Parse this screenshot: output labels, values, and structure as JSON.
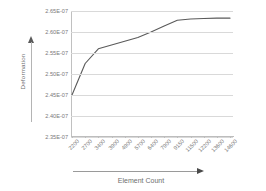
{
  "chart_data": {
    "type": "line",
    "title": "",
    "xlabel": "Element Count",
    "ylabel": "Deformation",
    "categories": [
      "2200",
      "2700",
      "3400",
      "3900",
      "4900",
      "5700",
      "6400",
      "7900",
      "9150",
      "11500",
      "12200",
      "13600",
      "14600"
    ],
    "values": [
      2.45e-07,
      2.525e-07,
      2.56e-07,
      2.569e-07,
      2.578e-07,
      2.587e-07,
      2.6e-07,
      2.614e-07,
      2.628e-07,
      2.631e-07,
      2.632e-07,
      2.633e-07,
      2.633e-07
    ],
    "y_tick_labels": [
      "2.65E-07",
      "2.60E-07",
      "2.55E-07",
      "2.50E-07",
      "2.45E-07",
      "2.40E-07",
      "2.35E-07"
    ],
    "y_tick_values": [
      2.65e-07,
      2.6e-07,
      2.55e-07,
      2.5e-07,
      2.45e-07,
      2.4e-07,
      2.35e-07
    ],
    "ylim": [
      2.35e-07,
      2.65e-07
    ],
    "grid": true,
    "legend": false,
    "series_color": "#5a5a5a",
    "grid_color": "#d9d9d9",
    "axis_color": "#bdbdbd",
    "text_color": "#7a7a7a"
  }
}
